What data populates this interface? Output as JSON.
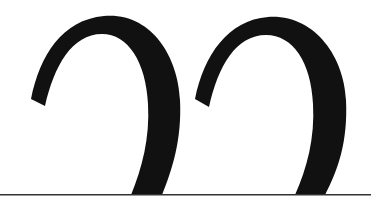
{
  "figure": {
    "glyphs": [
      {
        "char": "2",
        "note": "upper portion visible, cropped at baseline"
      },
      {
        "char": "2",
        "note": "upper portion visible, cropped at baseline"
      }
    ],
    "colors": {
      "glyph": "#111111",
      "baseline": "#333333",
      "background": "#ffffff"
    }
  }
}
